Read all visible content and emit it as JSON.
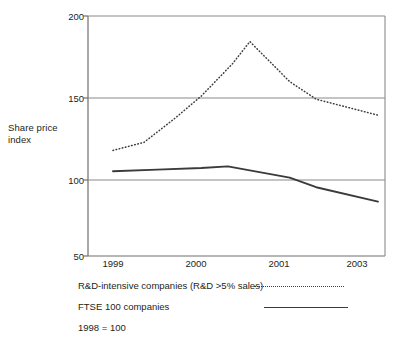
{
  "chart_data": {
    "type": "line",
    "title": "",
    "subtitle": "",
    "xlabel": "",
    "ylabel": "Share price index",
    "ylabel_lines": [
      "Share price",
      "index"
    ],
    "xlim": [
      1999,
      2003
    ],
    "ylim": [
      50,
      200
    ],
    "yticks": [
      200,
      150,
      100,
      50
    ],
    "ytick_labels": [
      "200",
      "150",
      "100",
      "50"
    ],
    "xticks": [
      1999,
      2000,
      2001,
      2003
    ],
    "xtick_labels": [
      "1999",
      "2000",
      "2001",
      "2003"
    ],
    "grid": "horizontal",
    "legend_position": "below",
    "note": "1998 = 100",
    "series": [
      {
        "name": "R&D-intensive companies (R&D >5% sales)",
        "style": "dotted",
        "color": "#3b3b3b",
        "x": [
          1999,
          1999.35,
          1999.7,
          2000,
          2000.35,
          2000.55,
          2001,
          2001.6,
          2003
        ],
        "values": [
          116,
          121,
          136,
          150,
          170,
          184,
          159,
          148,
          138
        ]
      },
      {
        "name": "FTSE 100 companies",
        "style": "solid",
        "color": "#3b3b3b",
        "x": [
          1999,
          1999.5,
          2000,
          2000.3,
          2001,
          2001.6,
          2003
        ],
        "values": [
          103,
          104,
          105,
          106,
          99,
          93,
          84
        ]
      }
    ]
  },
  "legend": {
    "items": [
      {
        "label": "R&D-intensive companies (R&D >5% sales)",
        "style": "dotted"
      },
      {
        "label": "FTSE 100 companies",
        "style": "solid"
      }
    ],
    "note": "1998 = 100"
  },
  "axes": {
    "y_label_line1": "Share price",
    "y_label_line2": "index",
    "y_ticks": [
      "200",
      "150",
      "100",
      "50"
    ],
    "x_ticks": [
      "1999",
      "2000",
      "2001",
      "2003"
    ]
  },
  "colors": {
    "line": "#3b3b3b",
    "grid": "#8a8a8a",
    "axis": "#6e6e6e",
    "text": "#231f20",
    "background": "#ffffff"
  }
}
